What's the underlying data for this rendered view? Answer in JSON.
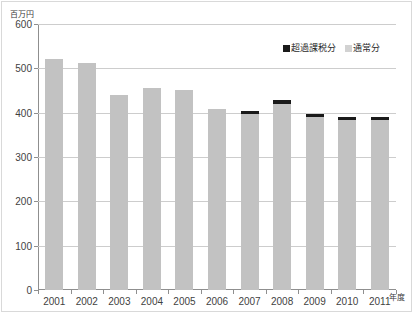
{
  "chart_data": {
    "type": "bar",
    "title": "",
    "subtitle": "",
    "xlabel": "年度",
    "ylabel": "百万円",
    "ylim": [
      0,
      600
    ],
    "ytick_step": 100,
    "yticks": [
      0,
      100,
      200,
      300,
      400,
      500,
      600
    ],
    "grid": true,
    "stacked": true,
    "legend_position": "top-right",
    "categories": [
      "2001",
      "2002",
      "2003",
      "2004",
      "2005",
      "2006",
      "2007",
      "2008",
      "2009",
      "2010",
      "2011"
    ],
    "series": [
      {
        "name": "通常分",
        "color": "#c2c2c2",
        "values": [
          520,
          513,
          440,
          456,
          452,
          408,
          397,
          420,
          391,
          384,
          384
        ]
      },
      {
        "name": "超過課税分",
        "color": "#1a1a1a",
        "values": [
          0,
          0,
          0,
          0,
          0,
          0,
          7,
          9,
          7,
          6,
          6
        ]
      }
    ],
    "totals": [
      520,
      513,
      440,
      456,
      452,
      408,
      404,
      429,
      398,
      390,
      390
    ]
  },
  "axis": {
    "unit_label": "百万円",
    "x_title": "年度",
    "y_tick_labels": [
      "600",
      "500",
      "400",
      "300",
      "200",
      "100",
      "0"
    ],
    "x_tick_labels": [
      "2001",
      "2002",
      "2003",
      "2004",
      "2005",
      "2006",
      "2007",
      "2008",
      "2009",
      "2010",
      "2011"
    ]
  },
  "legend": {
    "items": [
      {
        "label": "超過課税分",
        "swatch": "black-square-icon"
      },
      {
        "label": "通常分",
        "swatch": "gray-square-icon"
      }
    ]
  }
}
